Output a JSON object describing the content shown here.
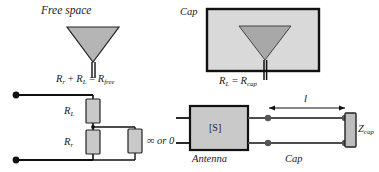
{
  "figure": {
    "kind": "antenna-equivalent-circuit-diagram",
    "panels": [
      {
        "id": "free-space",
        "title": "Free space",
        "equation": "R_r + R_L = R_free",
        "equation_parts": {
          "term1_base": "R",
          "term1_sub": "r",
          "plus": "+",
          "term2_base": "R",
          "term2_sub": "L",
          "equals": "=",
          "result_base": "R",
          "result_sub": "free"
        },
        "circuit": {
          "resistor_top_base": "R",
          "resistor_top_sub": "L",
          "resistor_bottom_base": "R",
          "resistor_bottom_sub": "r",
          "shunt_label": "∞ or 0"
        }
      },
      {
        "id": "cap",
        "title": "Cap",
        "equation": "R_L = R_cap",
        "equation_parts": {
          "term1_base": "R",
          "term1_sub": "L",
          "equals": "=",
          "result_base": "R",
          "result_sub": "cap"
        },
        "network": {
          "block_label": "[S]",
          "block_caption": "Antenna",
          "line_caption": "Cap",
          "length_label": "l",
          "load_base": "Z",
          "load_sub": "cap"
        }
      }
    ]
  },
  "colors": {
    "ink": "#1a1a1a",
    "box_fill": "#d9d9d9",
    "triangle_fill": "#a8a8a8",
    "triangle_fill_light": "#bfbfbf",
    "resistor_fill": "#cccccc",
    "page": "#ffffff"
  }
}
